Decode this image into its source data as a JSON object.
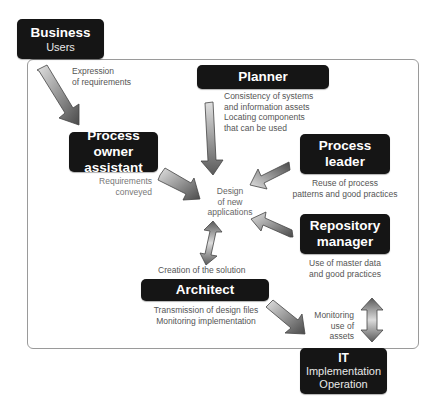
{
  "nodes": {
    "business": {
      "title": "Business",
      "subtitle": "Users"
    },
    "planner": {
      "title": "Planner"
    },
    "process_owner_assistant": {
      "title_line1": "Process owner",
      "title_line2": "assistant"
    },
    "process_leader": {
      "title_line1": "Process",
      "title_line2": "leader"
    },
    "repository_manager": {
      "title_line1": "Repository",
      "title_line2": "manager"
    },
    "architect": {
      "title": "Architect"
    },
    "it": {
      "title": "IT",
      "subtitle_line1": "Implementation",
      "subtitle_line2": "Operation"
    }
  },
  "center": {
    "line1": "Design",
    "line2": "of new",
    "line3": "applications"
  },
  "notes": {
    "expression": {
      "line1": "Expression",
      "line2": "of requirements"
    },
    "planner": {
      "line1": "Consistency of systems",
      "line2": "and information assets",
      "line3": "Locating components",
      "line4": "that can be used"
    },
    "requirements": {
      "line1": "Requirements",
      "line2": "conveyed"
    },
    "process_leader": {
      "line1": "Reuse of process",
      "line2": "patterns and good practices"
    },
    "repository": {
      "line1": "Use of master data",
      "line2": "and good practices"
    },
    "creation": {
      "line1": "Creation of the solution"
    },
    "architect": {
      "line1": "Transmission of design files",
      "line2": "Monitoring implementation"
    },
    "monitoring": {
      "line1": "Monitoring",
      "line2": "use of",
      "line3": "assets"
    }
  },
  "colors": {
    "box_fill": "#151515",
    "box_text": "#ffffff",
    "frame_border": "#9a9a9a",
    "arrow_dark": "#555555",
    "arrow_light": "#d8d8d8"
  }
}
